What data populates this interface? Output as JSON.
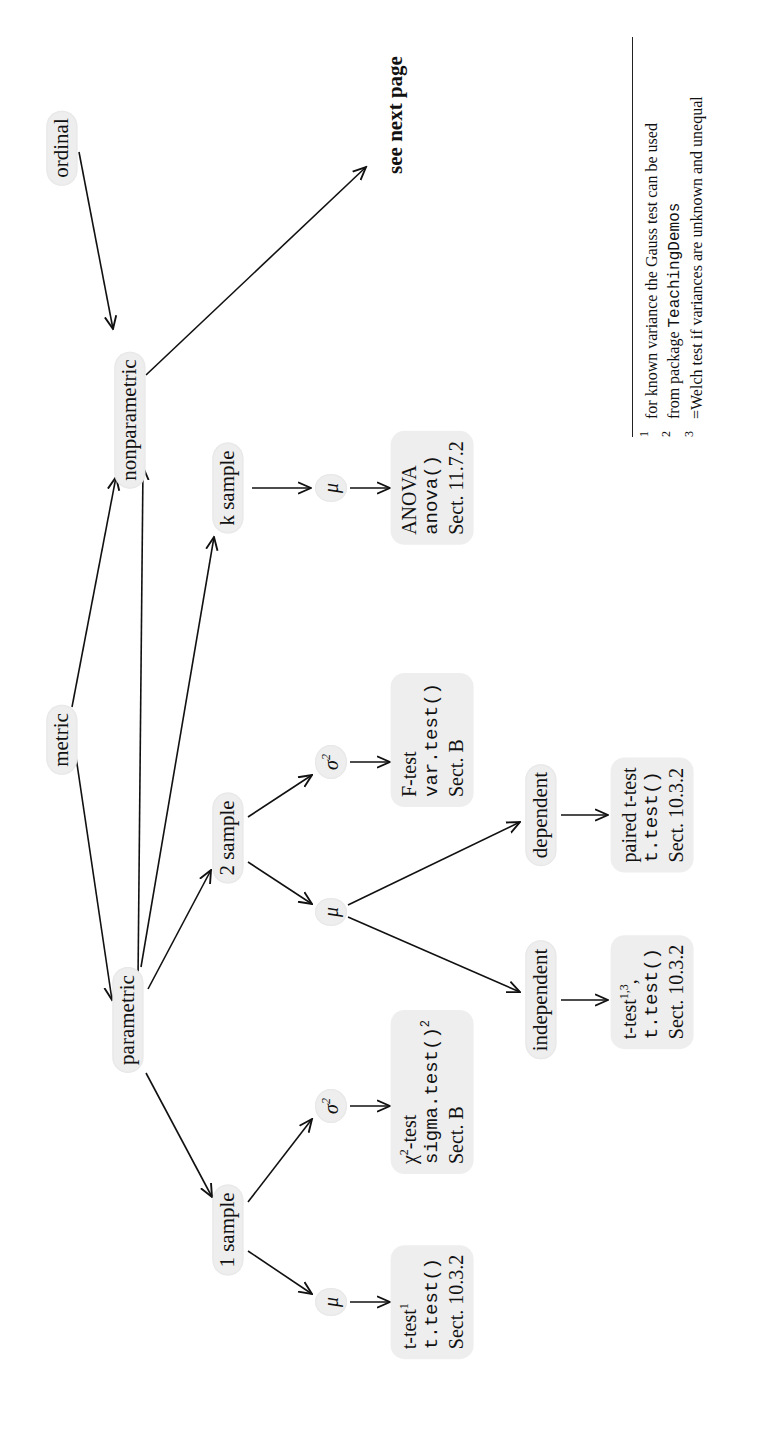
{
  "diagram": {
    "nodes": {
      "ordinal": "ordinal",
      "metric": "metric",
      "nonparametric": "nonparametric",
      "parametric": "parametric",
      "see_next_page": "see next page",
      "one_sample": "1 sample",
      "two_sample": "2 sample",
      "k_sample": "k sample",
      "mu": "μ",
      "sigma": "σ",
      "sigma_sup": "2",
      "independent": "independent",
      "dependent": "dependent"
    },
    "boxes": {
      "t_test_one": {
        "label": "t-test",
        "sup": "1",
        "code": "t.test()",
        "sect": "Sect. 10.3.2"
      },
      "chi2_test": {
        "label_pre": "χ",
        "label_sup": "2",
        "label_post": "-test",
        "code": "sigma.test()",
        "code_sup": "2",
        "sect": "Sect. B"
      },
      "f_test": {
        "label": "F-test",
        "code": "var.test()",
        "sect": "Sect. B"
      },
      "anova": {
        "label": "ANOVA",
        "code": "anova()",
        "sect": "Sect. 11.7.2"
      },
      "t_test_indep": {
        "label": "t-test",
        "sup": "1,3",
        "post": ",",
        "code": "t.test()",
        "sect": "Sect. 10.3.2"
      },
      "paired_t_test": {
        "label": "paired t-test",
        "code": "t.test()",
        "sect": "Sect. 10.3.2"
      }
    },
    "edges": [
      [
        "metric",
        "parametric"
      ],
      [
        "metric",
        "nonparametric"
      ],
      [
        "ordinal",
        "nonparametric"
      ],
      [
        "nonparametric",
        "see_next_page"
      ],
      [
        "parametric",
        "nonparametric"
      ],
      [
        "parametric",
        "one_sample"
      ],
      [
        "parametric",
        "two_sample"
      ],
      [
        "parametric",
        "k_sample"
      ],
      [
        "one_sample",
        "mu_1"
      ],
      [
        "one_sample",
        "sigma_1"
      ],
      [
        "two_sample",
        "mu_2"
      ],
      [
        "two_sample",
        "sigma_2"
      ],
      [
        "k_sample",
        "mu_k"
      ],
      [
        "mu_1",
        "t_test_one"
      ],
      [
        "sigma_1",
        "chi2_test"
      ],
      [
        "mu_2",
        "independent"
      ],
      [
        "mu_2",
        "dependent"
      ],
      [
        "sigma_2",
        "f_test"
      ],
      [
        "mu_k",
        "anova"
      ],
      [
        "independent",
        "t_test_indep"
      ],
      [
        "dependent",
        "paired_t_test"
      ]
    ]
  },
  "footnotes": [
    {
      "num": "1",
      "text": "for known variance the Gauss test can be used"
    },
    {
      "num": "2",
      "text_pre": "from package ",
      "mono": "TeachingDemos"
    },
    {
      "num": "3",
      "text": "=Welch test if variances are unknown and unequal"
    }
  ]
}
